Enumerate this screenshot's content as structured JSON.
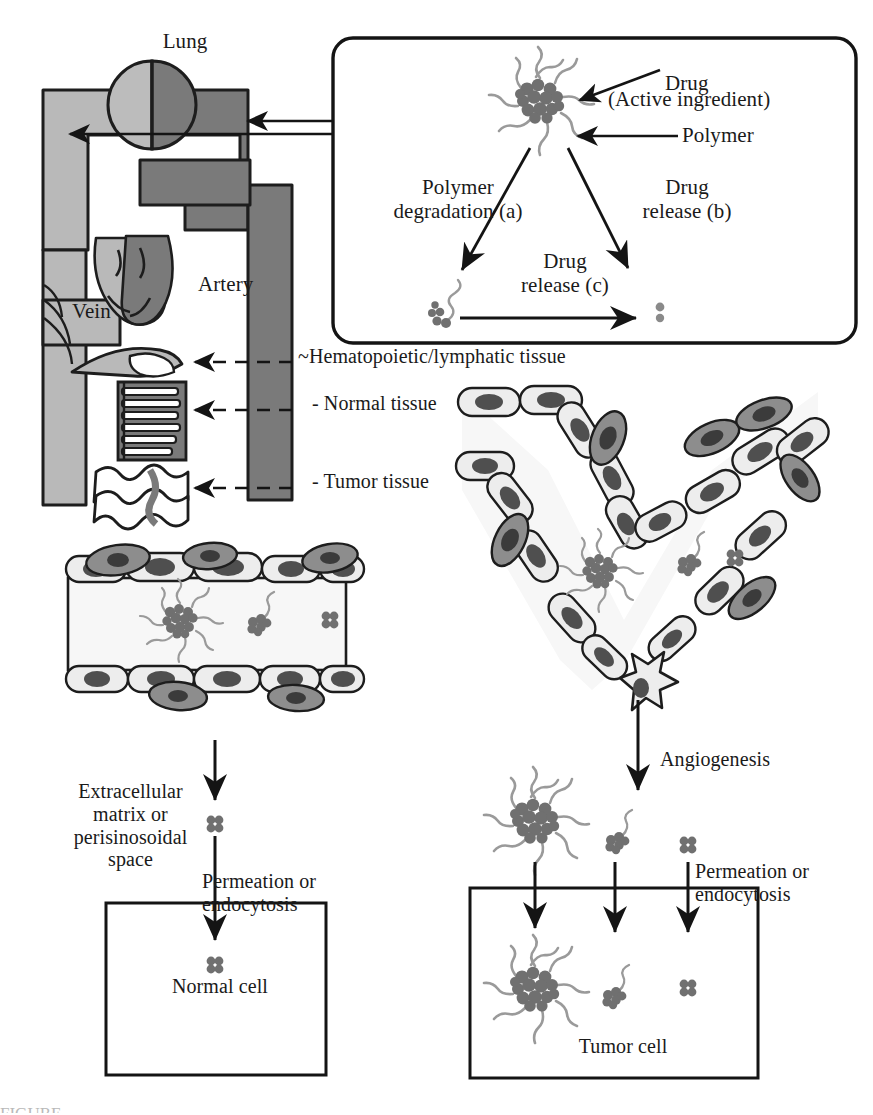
{
  "figure": {
    "caption_fragment": "FIGURE"
  },
  "colors": {
    "vein_light_gray": "#b9b9b9",
    "artery_dark_gray": "#7a7a7a",
    "cell_body_light": "#ebebeb",
    "cell_nucleus_dark": "#4f4f4f",
    "detached_cell_gray": "#8d8d8d",
    "drug_particle_gray": "#707070",
    "polymer_chain_gray": "#9a9a9a",
    "stroke_black": "#141414",
    "background": "#ffffff"
  },
  "circulatory": {
    "labels": {
      "lung": "Lung",
      "vein": "Vein",
      "artery": "Artery",
      "hematopoietic": "~Hematopoietic/lymphatic tissue",
      "normal_tissue": "- Normal tissue",
      "tumor_tissue": "- Tumor tissue"
    }
  },
  "inset": {
    "labels": {
      "drug": "Drug",
      "active_ingredient": "(Active ingredient)",
      "polymer": "Polymer",
      "polymer_degradation": "Polymer\ndegradation (a)",
      "drug_release_b": "Drug\nrelease (b)",
      "drug_release_c": "Drug\nrelease (c)"
    }
  },
  "normal_pathway": {
    "labels": {
      "extracellular": "Extracellular\nmatrix or\nperisinosoidal\nspace",
      "permeation": "Permeation or\nendocytosis",
      "normal_cell": "Normal cell"
    }
  },
  "tumor_pathway": {
    "labels": {
      "angiogenesis": "Angiogenesis",
      "permeation": "Permeation or\nendocytosis",
      "tumor_cell": "Tumor cell"
    }
  },
  "icons": {
    "micelle": "polymeric-micelle-icon",
    "conjugate": "drug-polymer-conjugate-icon",
    "free_drug": "free-drug-molecule-icon",
    "endothelial_cell": "endothelial-cell-icon",
    "sprouting_cell": "sprouting-endothelial-cell-icon",
    "arrow": "arrow-icon"
  }
}
